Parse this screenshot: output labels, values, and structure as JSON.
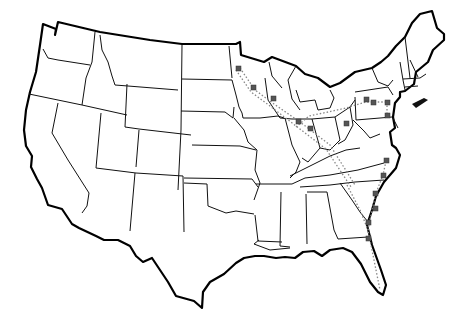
{
  "map": {
    "title": "",
    "region": "Continental United States",
    "colors": {
      "background": "#ffffff",
      "border": "#000000",
      "state_line": "#111111",
      "route": "#888888",
      "marker": "#555555"
    },
    "routes": [
      {
        "name": "route-upper-midwest-to-ohio-valley",
        "points": [
          [
            240,
            68
          ],
          [
            255,
            90
          ],
          [
            274,
            104
          ],
          [
            300,
            122
          ],
          [
            330,
            145
          ],
          [
            355,
            185
          ]
        ]
      },
      {
        "name": "route-ohio-to-pennsylvania",
        "points": [
          [
            296,
            127
          ],
          [
            309,
            116
          ],
          [
            328,
            112
          ],
          [
            344,
            108
          ],
          [
            370,
            104
          ],
          [
            388,
            95
          ]
        ]
      },
      {
        "name": "route-pennsylvania-chain",
        "points": [
          [
            366,
            103
          ],
          [
            378,
            106
          ],
          [
            387,
            106
          ],
          [
            387,
            120
          ]
        ]
      },
      {
        "name": "route-southeast-coast",
        "points": [
          [
            385,
            160
          ],
          [
            383,
            175
          ],
          [
            376,
            193
          ],
          [
            372,
            210
          ],
          [
            370,
            230
          ],
          [
            372,
            250
          ],
          [
            380,
            290
          ]
        ]
      },
      {
        "name": "route-ga-branch",
        "points": [
          [
            347,
            185
          ],
          [
            360,
            210
          ],
          [
            372,
            230
          ]
        ]
      }
    ],
    "markers": [
      {
        "name": "marker-mn-1",
        "x": 239,
        "y": 69
      },
      {
        "name": "marker-mn-2",
        "x": 253,
        "y": 88
      },
      {
        "name": "marker-mn-3",
        "x": 273,
        "y": 99
      },
      {
        "name": "marker-il",
        "x": 298,
        "y": 121
      },
      {
        "name": "marker-in",
        "x": 310,
        "y": 129
      },
      {
        "name": "marker-oh",
        "x": 346,
        "y": 124
      },
      {
        "name": "marker-oh-2",
        "x": 364,
        "y": 108
      },
      {
        "name": "marker-pa-1",
        "x": 366,
        "y": 99
      },
      {
        "name": "marker-pa-2",
        "x": 373,
        "y": 102
      },
      {
        "name": "marker-pa-3",
        "x": 387,
        "y": 102
      },
      {
        "name": "marker-pa-4",
        "x": 387,
        "y": 115
      },
      {
        "name": "marker-nc-1",
        "x": 386,
        "y": 161
      },
      {
        "name": "marker-nc-2",
        "x": 383,
        "y": 175
      },
      {
        "name": "marker-sc-1",
        "x": 375,
        "y": 193
      },
      {
        "name": "marker-sc-2",
        "x": 375,
        "y": 209
      },
      {
        "name": "marker-ga-1",
        "x": 368,
        "y": 222
      },
      {
        "name": "marker-ga-2",
        "x": 368,
        "y": 238
      }
    ]
  }
}
